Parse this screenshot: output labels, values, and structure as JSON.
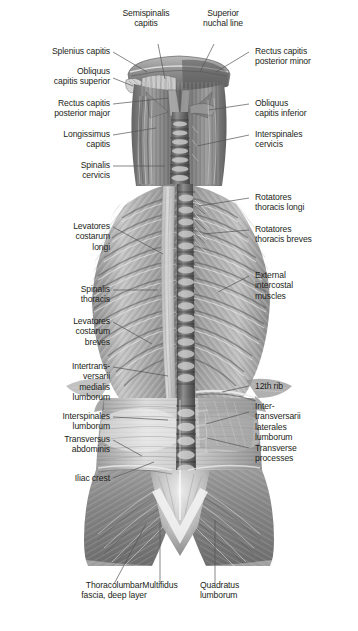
{
  "figure": {
    "view": "posterior",
    "background": "#ffffff",
    "ink": "#231f20",
    "leader_color": "#555555"
  },
  "labels": {
    "semispinalis_capitis": "Semispinalis\ncapitis",
    "superior_nuchal_line": "Superior\nnuchal line",
    "splenius_capitis": "Splenius capitis",
    "obliquus_capitis_superior": "Obliquus\ncapitis superior",
    "rectus_capitis_posterior_major": "Rectus capitis\nposterior major",
    "longissimus_capitis": "Longissimus\ncapitis",
    "spinalis_cervicis": "Spinalis\ncervicis",
    "levatores_costarum_longi": "Levatores\ncostarum\nlongi",
    "spinalis_thoracis": "Spinalis\nthoracis",
    "levatores_costarum_breves": "Levatores\ncostarum\nbreves",
    "intertransversarii_mediales_lumborum": "Intertrans-\nversarii\nmedialis\nlumborum",
    "interspinales_lumborum": "Interspinales\nlumborum",
    "transversus_abdominis": "Transversus\nabdominis",
    "iliac_crest": "Iliac crest",
    "rectus_capitis_posterior_minor": "Rectus capitis\nposterior minor",
    "obliquus_capitis_inferior": "Obliquus\ncapitis inferior",
    "interspinales_cervicis": "Interspinales\ncervicis",
    "rotatores_thoracis_longi": "Rotatores\nthoracis longi",
    "rotatores_thoracis_breves": "Rotatores\nthoracis breves",
    "external_intercostal_muscles": "External\nintercostal\nmuscles",
    "twelfth_rib": "12th rib",
    "intertransversarii_laterales_lumborum": "Inter-\ntransversarii\nlaterales\nlumborum",
    "transverse_processes": "Transverse\nprocesses",
    "thoracolumbar_fascia_deep_layer": "Thoracolumbar\nfascia, deep layer",
    "multifidus": "Multifidus",
    "quadratus_lumborum": "Quadratus\nlumborum"
  }
}
